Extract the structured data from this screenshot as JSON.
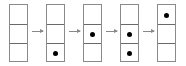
{
  "diagram": {
    "columns": [
      {
        "x": 9,
        "dots": [
          false,
          false,
          false
        ]
      },
      {
        "x": 46,
        "dots": [
          false,
          false,
          true
        ]
      },
      {
        "x": 83,
        "dots": [
          false,
          true,
          false
        ]
      },
      {
        "x": 120,
        "dots": [
          false,
          true,
          true
        ]
      },
      {
        "x": 157,
        "dots": [
          true,
          false,
          false
        ]
      }
    ],
    "arrows": [
      {
        "x": 32
      },
      {
        "x": 69
      },
      {
        "x": 106
      },
      {
        "x": 143
      }
    ],
    "colors": {
      "border": "#8a8a8a",
      "divider": "#6a6a6a",
      "dot": "#000000",
      "arrow": "#888888"
    }
  }
}
